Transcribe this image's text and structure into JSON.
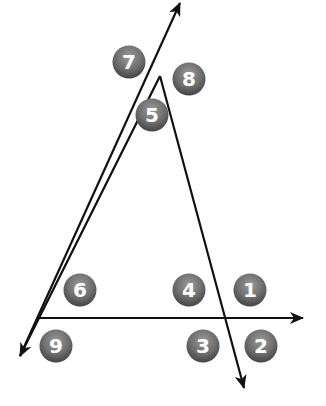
{
  "diagram": {
    "colors": {
      "line": "#111111",
      "badge_light": "#8a8a8a",
      "badge_dark": "#4a4a4a",
      "badge_text": "#ffffff"
    },
    "lines": [
      {
        "name": "left-line",
        "x1": 20,
        "y1": 356,
        "x2": 180,
        "y2": 3
      },
      {
        "name": "right-line",
        "x1": 160,
        "y1": 76,
        "x2": 244,
        "y2": 388
      },
      {
        "name": "horizontal-line",
        "x1": 38,
        "y1": 318,
        "x2": 303,
        "y2": 318
      }
    ],
    "badges": [
      {
        "label": "1",
        "cx": 250,
        "cy": 290
      },
      {
        "label": "2",
        "cx": 261,
        "cy": 346
      },
      {
        "label": "3",
        "cx": 203,
        "cy": 346
      },
      {
        "label": "4",
        "cx": 189,
        "cy": 290
      },
      {
        "label": "5",
        "cx": 152,
        "cy": 115
      },
      {
        "label": "6",
        "cx": 80,
        "cy": 290
      },
      {
        "label": "7",
        "cx": 129,
        "cy": 62
      },
      {
        "label": "8",
        "cx": 189,
        "cy": 79
      },
      {
        "label": "9",
        "cx": 56,
        "cy": 346
      }
    ]
  }
}
